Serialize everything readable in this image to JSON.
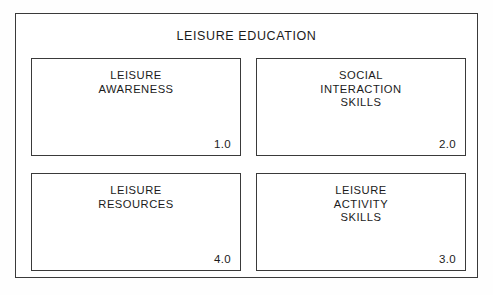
{
  "diagram": {
    "title": "LEISURE EDUCATION",
    "type": "component-model",
    "boxes": [
      {
        "id": "leisure-awareness",
        "label": "LEISURE\nAWARENESS",
        "number": "1.0",
        "row": 0,
        "column": 0
      },
      {
        "id": "social-interaction-skills",
        "label": "SOCIAL\nINTERACTION\nSKILLS",
        "number": "2.0",
        "row": 0,
        "column": 1
      },
      {
        "id": "leisure-resources",
        "label": "LEISURE\nRESOURCES",
        "number": "4.0",
        "row": 1,
        "column": 0
      },
      {
        "id": "leisure-activity-skills",
        "label": "LEISURE\nACTIVITY\nSKILLS",
        "number": "3.0",
        "row": 1,
        "column": 1
      }
    ],
    "colors": {
      "background": "#ffffff",
      "border": "#3a3a3a",
      "text": "#1b1b1b"
    }
  }
}
